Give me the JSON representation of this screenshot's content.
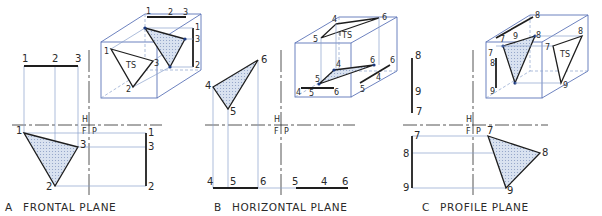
{
  "colors": {
    "projection_line": "#8aa0cc",
    "box_line": "#5c74b8",
    "edge": "#1e1e1e",
    "fill": "#cfdaea"
  },
  "fold_labels": {
    "h": "H",
    "f": "F",
    "p": "P"
  },
  "panels": [
    {
      "letter": "A",
      "title": "FRONTAL PLANE",
      "top_view": {
        "points": [
          "1",
          "2",
          "3"
        ]
      },
      "front_view": {
        "points": [
          "1",
          "2",
          "3"
        ]
      },
      "side_view": {
        "points": [
          "1",
          "3",
          "2"
        ]
      },
      "pictorial": {
        "ts_label": "TS",
        "labels": [
          "1",
          "2",
          "3",
          "1",
          "3",
          "2",
          "1",
          "3",
          "2"
        ]
      }
    },
    {
      "letter": "B",
      "title": "HORIZONTAL PLANE",
      "top_view": {
        "points": [
          "4",
          "5",
          "6"
        ]
      },
      "front_view": {
        "points": [
          "4",
          "5",
          "6"
        ]
      },
      "side_view": {
        "points": [
          "5",
          "4",
          "6"
        ]
      },
      "pictorial": {
        "ts_label": "TS",
        "labels": [
          "4",
          "6",
          "5",
          "4",
          "6",
          "6",
          "5",
          "4",
          "5",
          "6",
          "5",
          "4"
        ]
      }
    },
    {
      "letter": "C",
      "title": "PROFILE PLANE",
      "top_view": {
        "points": [
          "8",
          "9",
          "7"
        ]
      },
      "front_view": {
        "points": [
          "7",
          "8",
          "9"
        ]
      },
      "side_view": {
        "points": [
          "7",
          "8",
          "9"
        ]
      },
      "pictorial": {
        "ts_label": "TS",
        "labels": [
          "8",
          "7",
          "9",
          "8",
          "7",
          "8",
          "9",
          "7",
          "8",
          "9"
        ]
      }
    }
  ]
}
